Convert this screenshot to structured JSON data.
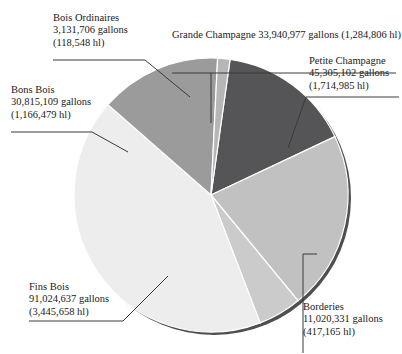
{
  "chart_data": {
    "type": "pie",
    "title": "",
    "unit_primary": "gallons",
    "unit_secondary": "hl",
    "legend_position": "callout-labels",
    "grid": false,
    "categories": [
      "Grande Champagne",
      "Petite Champagne",
      "Borderies",
      "Fins Bois",
      "Bons Bois",
      "Bois Ordinaires"
    ],
    "values": [
      33940977,
      45305102,
      11020331,
      91024637,
      30815109,
      3131706
    ],
    "values_hl": [
      1284806,
      1714985,
      417165,
      3445658,
      1166479,
      118548
    ],
    "slices": [
      {
        "name": "Grande Champagne",
        "gallons": 33940977,
        "gallons_text": "33,940,977 gallons",
        "hl": 1284806,
        "hl_text": "(1,284,806 hl)",
        "label_text": "Grande Champagne 33,940,977 gallons (1,284,806 hl)",
        "color": "#555557"
      },
      {
        "name": "Petite Champagne",
        "gallons": 45305102,
        "gallons_text": "45,305,102 gallons",
        "hl": 1714985,
        "hl_text": "(1,714,985 hl)",
        "color": "#c1c1c1"
      },
      {
        "name": "Borderies",
        "gallons": 11020331,
        "gallons_text": "11,020,331 gallons",
        "hl": 417165,
        "hl_text": "(417,165 hl)",
        "color": "#cbcbcb"
      },
      {
        "name": "Fins Bois",
        "gallons": 91024637,
        "gallons_text": "91,024,637 gallons",
        "hl": 3445658,
        "hl_text": "(3,445,658 hl)",
        "color": "#ededed"
      },
      {
        "name": "Bons Bois",
        "gallons": 30815109,
        "gallons_text": "30,815,109 gallons",
        "hl": 1166479,
        "hl_text": "(1,166,479 hl)",
        "color": "#9b9b9b"
      },
      {
        "name": "Bois Ordinaires",
        "gallons": 3131706,
        "gallons_text": "3,131,706 gallons",
        "hl": 118548,
        "hl_text": "(118,548 hl)",
        "color": "#b6b6b6"
      }
    ]
  },
  "labels": {
    "bois_ordinaires": {
      "name": "Bois Ordinaires",
      "gallons": "3,131,706 gallons",
      "hl": "(118,548 hl)"
    },
    "grande_champagne": {
      "line": "Grande Champagne 33,940,977 gallons (1,284,806 hl)"
    },
    "petite_champagne": {
      "name": "Petite Champagne",
      "gallons": "45,305,102 gallons",
      "hl": "(1,714,985 hl)"
    },
    "bons_bois": {
      "name": "Bons Bois",
      "gallons": "30,815,109 gallons",
      "hl": "(1,166,479 hl)"
    },
    "fins_bois": {
      "name": "Fins Bois",
      "gallons": "91,024,637 gallons",
      "hl": "(3,445,658 hl)"
    },
    "borderies": {
      "name": "Borderies",
      "gallons": "11,020,331 gallons",
      "hl": "(417,165 hl)"
    }
  },
  "style": {
    "background": "#ffffff",
    "shadow_color": "#4a4a4a",
    "leader_color": "#3a3a3a"
  }
}
